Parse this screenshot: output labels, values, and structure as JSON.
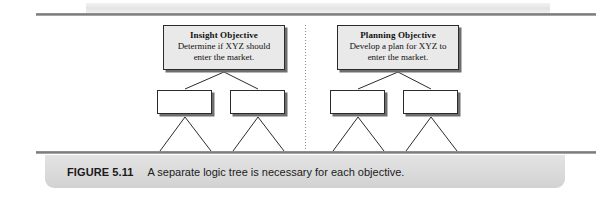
{
  "figure": {
    "number_label": "FIGURE 5.11",
    "caption": "A separate logic tree is necessary for each objective."
  },
  "diagram": {
    "divider": "vertical-dotted-divider",
    "trees": [
      {
        "id": "insight-tree",
        "objective": {
          "title": "Insight Objective",
          "line1": "Determine if XYZ should",
          "line2": "enter the market."
        },
        "children": [
          {
            "id": "insight-branch-1",
            "label": ""
          },
          {
            "id": "insight-branch-2",
            "label": ""
          }
        ]
      },
      {
        "id": "planning-tree",
        "objective": {
          "title": "Planning Objective",
          "line1": "Develop a plan for XYZ to",
          "line2": "enter the market."
        },
        "children": [
          {
            "id": "planning-branch-1",
            "label": ""
          },
          {
            "id": "planning-branch-2",
            "label": ""
          }
        ]
      }
    ]
  },
  "colors": {
    "rule": "#7d7d7d",
    "objective_fill": "#e9e9e9",
    "leaf_fill": "#ffffff",
    "box_border": "#2b2b2b",
    "shadow": "#6e6e6e",
    "caption_panel": "#dcdcdc",
    "text": "#1a1a1a"
  }
}
